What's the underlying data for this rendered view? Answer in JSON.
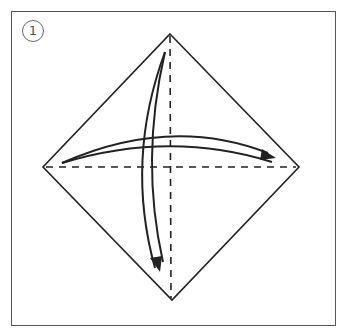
{
  "diagram": {
    "step_number": "1",
    "colors": {
      "line": "#222222",
      "frame": "#555555"
    },
    "square": {
      "top": [
        170,
        34
      ],
      "right": [
        299,
        167
      ],
      "bottom": [
        172,
        300
      ],
      "left": [
        43,
        167
      ]
    },
    "fold_lines": [
      {
        "type": "valley-dashed",
        "orientation": "vertical"
      },
      {
        "type": "valley-dashed",
        "orientation": "horizontal"
      }
    ],
    "arrows": [
      {
        "direction": "left-to-right",
        "meaning": "fold and unfold"
      },
      {
        "direction": "top-to-bottom",
        "meaning": "fold and unfold"
      }
    ]
  }
}
